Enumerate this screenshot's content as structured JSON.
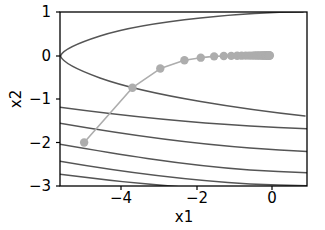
{
  "chart_data": {
    "type": "line",
    "title": "",
    "subtitle": "",
    "xlabel": "x1",
    "ylabel": "x2",
    "xlim": [
      -5.65,
      1.0
    ],
    "ylim": [
      -3.0,
      1.0
    ],
    "xticks": [
      -4,
      -2,
      0
    ],
    "xticklabels": [
      "−4",
      "−2",
      "0"
    ],
    "yticks": [
      1,
      0,
      -1,
      -2,
      -3
    ],
    "yticklabels": [
      "1",
      "0",
      "−1",
      "−2",
      "−3"
    ],
    "grid": false,
    "legend": null,
    "series": [
      {
        "name": "optimization-trajectory",
        "type": "line-with-markers",
        "color": "#adadad",
        "marker": "circle",
        "x": [
          -5.0,
          -3.7,
          -2.95,
          -2.3,
          -1.86,
          -1.5,
          -1.24,
          -1.04,
          -0.88,
          -0.76,
          -0.65,
          -0.56,
          -0.48,
          -0.41,
          -0.35,
          -0.3,
          -0.25,
          -0.21,
          -0.18,
          -0.15,
          -0.12,
          -0.1,
          -0.08,
          -0.06,
          -0.05,
          -0.04,
          -0.03,
          -0.02,
          -0.01,
          0.0
        ],
        "y": [
          -2.0,
          -0.74,
          -0.3,
          -0.11,
          -0.05,
          -0.02,
          -0.012,
          -0.008,
          -0.005,
          -0.004,
          -0.003,
          -0.002,
          -0.002,
          -0.001,
          -0.001,
          -0.001,
          0.0,
          0.0,
          0.0,
          0.0,
          0.0,
          0.0,
          0.0,
          0.0,
          0.0,
          0.0,
          0.0,
          0.0,
          0.0,
          0.0
        ]
      }
    ],
    "contours": {
      "color": "#555555",
      "description": "nested rightward-opening parabolic level sets of an objective function with vertex region near (-5.7, 0)",
      "levels": [
        {
          "name": "closed-parabola-upper-lower",
          "vertex_x": -5.72,
          "vertex_y": 0.0,
          "coeff": 0.0705
        },
        {
          "name": "branch-1",
          "left_y": -1.22,
          "right_y": -1.27
        },
        {
          "name": "branch-2",
          "left_y": -1.6,
          "right_y": -1.75
        },
        {
          "name": "branch-3",
          "left_y": -2.08,
          "right_y": -2.2
        },
        {
          "name": "branch-4",
          "left_y": -2.48,
          "right_y": -2.58
        },
        {
          "name": "branch-5",
          "left_y": -2.78,
          "right_y": -2.88
        }
      ]
    }
  }
}
